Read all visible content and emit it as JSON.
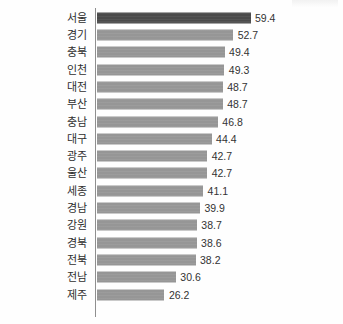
{
  "chart_data": {
    "type": "bar",
    "orientation": "horizontal",
    "title": "",
    "subtitle": "",
    "xlabel": "",
    "ylabel": "",
    "grid": false,
    "legend": null,
    "xlim": [
      0,
      59.4
    ],
    "axis_ticks": [],
    "highlight_category": "서울",
    "colors": {
      "bar": "#969696",
      "bar_highlight": "#4a4a4a",
      "axis": "#8f8f8f",
      "label_text": "#2f2f2f",
      "value_text": "#333333",
      "background": "#fefefe"
    },
    "categories": [
      "서울",
      "경기",
      "충북",
      "인천",
      "대전",
      "부산",
      "충남",
      "대구",
      "광주",
      "울산",
      "세종",
      "경남",
      "강원",
      "경북",
      "전북",
      "전남",
      "제주"
    ],
    "values": [
      59.4,
      52.7,
      49.4,
      49.3,
      48.7,
      48.7,
      46.8,
      44.4,
      42.7,
      42.7,
      41.1,
      39.9,
      38.7,
      38.6,
      38.2,
      30.6,
      26.2
    ],
    "value_labels": [
      "59.4",
      "52.7",
      "49.4",
      "49.3",
      "48.7",
      "48.7",
      "46.8",
      "44.4",
      "42.7",
      "42.7",
      "41.1",
      "39.9",
      "38.7",
      "38.6",
      "38.2",
      "30.6",
      "26.2"
    ]
  }
}
